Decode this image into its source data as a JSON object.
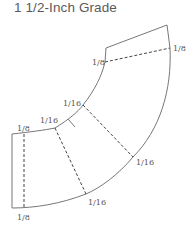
{
  "title": "1 1/2-Inch Grade",
  "labels": {
    "top_left": "1/8",
    "top_right": "1/8",
    "mid_upper": "1/16",
    "mid_lower": "1/16",
    "left_top": "1/8",
    "left_bottom": "1/8",
    "right_lower": "1/16",
    "bottom_mid": "1/16"
  }
}
